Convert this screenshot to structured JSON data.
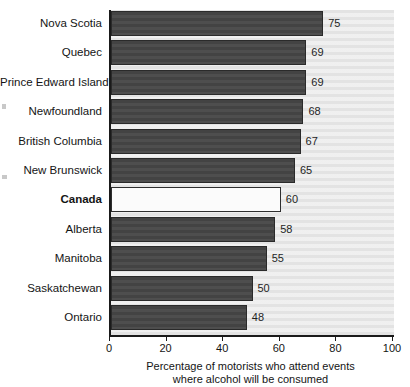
{
  "chart_data": {
    "type": "bar",
    "orientation": "horizontal",
    "title": "",
    "xlabel": "Percentage of motorists who attend events where alcohol will be consumed",
    "ylabel": "",
    "xlim": [
      0,
      100
    ],
    "xticks": [
      0,
      20,
      40,
      60,
      80,
      100
    ],
    "grid": false,
    "legend": "none",
    "categories": [
      "Nova Scotia",
      "Quebec",
      "Prince Edward Island",
      "Newfoundland",
      "British Columbia",
      "New Brunswick",
      "Canada",
      "Alberta",
      "Manitoba",
      "Saskatchewan",
      "Ontario"
    ],
    "values": [
      75,
      69,
      69,
      68,
      67,
      65,
      60,
      58,
      55,
      50,
      48
    ],
    "highlight_category": "Canada",
    "colors": {
      "bar": "#434343",
      "bar_highlight": "#fbfbfb",
      "bar_border": "#2a2a2a",
      "plot_background": "#e3e3e3",
      "axis": "#1a1a1a",
      "text": "#141414"
    }
  },
  "caption": {
    "line1": "Percentage of motorists who attend events",
    "line2": "where alcohol will be consumed"
  }
}
